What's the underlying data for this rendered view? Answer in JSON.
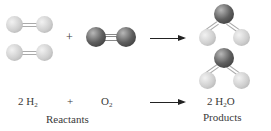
{
  "reaction": {
    "plus_sign": "+",
    "equation": {
      "reactant1_coef": "2 H",
      "reactant1_sub": "2",
      "plus": "+",
      "reactant2": "O",
      "reactant2_sub": "2",
      "product_coef": "2 H",
      "product_sub": "2",
      "product_rest": "O"
    },
    "labels": {
      "reactants": "Reactants",
      "products": "Products"
    }
  },
  "colors": {
    "hydrogen": "#cfcfcf",
    "oxygen": "#4a4a4a",
    "arrow": "#222222"
  }
}
